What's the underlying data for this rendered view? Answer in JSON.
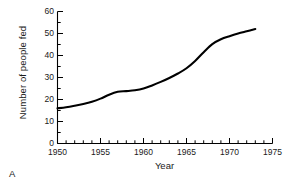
{
  "figure": {
    "panel_letter": "A",
    "background_color": "#ffffff",
    "line_color": "#000000"
  },
  "chart_data": {
    "type": "line",
    "title": "",
    "xlabel": "Year",
    "ylabel": "Number of people fed",
    "xlim": [
      1950,
      1975
    ],
    "ylim": [
      0,
      60
    ],
    "grid": false,
    "legend": null,
    "x_major_ticks": [
      1950,
      1955,
      1960,
      1965,
      1970,
      1975
    ],
    "x_tick_labels": [
      "1950",
      "1955",
      "1960",
      "1965",
      "1970",
      "1975"
    ],
    "x_minor_tick_step": 1,
    "y_major_ticks": [
      0,
      10,
      20,
      30,
      40,
      50,
      60
    ],
    "y_tick_labels": [
      "0",
      "10",
      "20",
      "30",
      "40",
      "50",
      "60"
    ],
    "y_minor_tick_step": 5,
    "series": [
      {
        "name": "Number of people fed",
        "x": [
          1950,
          1951,
          1952,
          1953,
          1954,
          1955,
          1956,
          1957,
          1958,
          1959,
          1960,
          1961,
          1962,
          1963,
          1964,
          1965,
          1966,
          1967,
          1968,
          1969,
          1970,
          1971,
          1972,
          1973
        ],
        "values": [
          16.0,
          16.5,
          17.2,
          18.0,
          19.0,
          20.4,
          22.2,
          23.5,
          23.8,
          24.2,
          25.0,
          26.4,
          28.0,
          29.8,
          31.8,
          34.2,
          37.5,
          41.5,
          45.2,
          47.4,
          48.8,
          50.0,
          51.0,
          52.0
        ]
      }
    ]
  }
}
